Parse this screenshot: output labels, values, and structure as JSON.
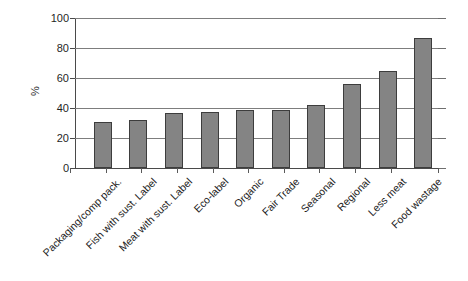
{
  "chart_data": {
    "type": "bar",
    "title": "",
    "xlabel": "",
    "ylabel": "%",
    "ylim": [
      0,
      100
    ],
    "yticks": [
      0,
      20,
      40,
      60,
      80,
      100
    ],
    "grid": true,
    "legend": "none",
    "orientation": "vertical",
    "bar_color": "#848484",
    "bar_edge_color": "#3d3d3d",
    "categories": [
      "Packaging/comp pack.",
      "Fish with sust. Label",
      "Meat with sust. Label",
      "Eco-label",
      "Organic",
      "Fair Trade",
      "Seasonal",
      "Regional",
      "Less meat",
      "Food wastage"
    ],
    "values": [
      31,
      32,
      37,
      37.5,
      39,
      39,
      42,
      56,
      65,
      86.5
    ]
  },
  "axis": {
    "y_title": "%",
    "tick_labels": [
      "0",
      "20",
      "40",
      "60",
      "80",
      "100"
    ]
  }
}
